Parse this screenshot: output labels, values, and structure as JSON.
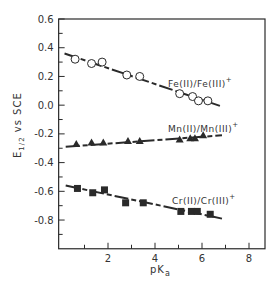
{
  "chart_data": {
    "type": "scatter",
    "title": "",
    "xlabel": "pKa",
    "ylabel": "E1/2 vs SCE",
    "xlim": [
      -0.1,
      8.6
    ],
    "ylim": [
      -1.0,
      0.6
    ],
    "x_ticks": [
      2,
      4,
      6,
      8
    ],
    "x_minor_ticks": [
      1,
      3,
      5,
      7
    ],
    "y_ticks": [
      0.6,
      0.4,
      0.2,
      0.0,
      -0.2,
      -0.4,
      -0.6,
      -0.8
    ],
    "y_tick_labels": [
      "0.6",
      "0.4",
      "0.2",
      "0.0",
      "-0.2",
      "-0.4",
      "-0.6",
      "-0.8"
    ],
    "x_tick_labels": [
      "2",
      "4",
      "6",
      "8"
    ],
    "grid": false,
    "legend": "inline labels",
    "series": [
      {
        "name": "Fe(II)/Fe(III)+",
        "marker": "open-circle",
        "x": [
          0.6,
          1.3,
          1.75,
          2.8,
          3.35,
          5.05,
          5.6,
          5.85,
          6.25
        ],
        "y": [
          0.32,
          0.29,
          0.3,
          0.21,
          0.2,
          0.08,
          0.06,
          0.03,
          0.03
        ],
        "fit_line": {
          "x": [
            0.15,
            6.85
          ],
          "y": [
            0.36,
            -0.01
          ]
        }
      },
      {
        "name": "Mn(II)/Mn(III)+",
        "marker": "filled-triangle",
        "x": [
          0.65,
          1.3,
          1.8,
          2.85,
          3.35,
          5.05,
          5.5,
          5.7,
          6.05
        ],
        "y": [
          -0.27,
          -0.26,
          -0.26,
          -0.25,
          -0.25,
          -0.24,
          -0.23,
          -0.23,
          -0.21
        ],
        "fit_line": {
          "x": [
            0.2,
            6.85
          ],
          "y": [
            -0.29,
            -0.21
          ]
        }
      },
      {
        "name": "Cr(II)/Cr(III)+",
        "marker": "filled-square",
        "x": [
          0.7,
          1.35,
          1.85,
          2.75,
          3.5,
          5.1,
          5.55,
          5.8,
          6.35
        ],
        "y": [
          -0.58,
          -0.61,
          -0.59,
          -0.68,
          -0.68,
          -0.74,
          -0.74,
          -0.74,
          -0.76
        ],
        "fit_line": {
          "x": [
            0.2,
            6.85
          ],
          "y": [
            -0.56,
            -0.79
          ]
        }
      }
    ]
  },
  "labels": {
    "y_axis_main": "E",
    "y_axis_sub": "1/2",
    "y_axis_rest": " vs SCE",
    "x_axis_main": "pK",
    "x_axis_sub": "a",
    "fe_label": "Fe(II)/Fe(III)",
    "mn_label": "Mn(II)/Mn(III)",
    "cr_label": "Cr(II)/Cr(III)",
    "plus": "+"
  }
}
